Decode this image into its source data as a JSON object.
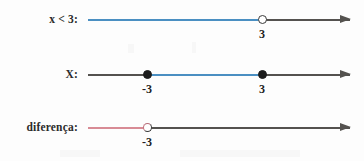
{
  "figure": {
    "type": "number-line-diagram",
    "background_color": "#fdfdfd",
    "axis_color": "#54524f",
    "width": 364,
    "height": 161
  },
  "colors": {
    "blue": "#4a8fc2",
    "red": "#d88b95",
    "dot_fill": "#1c1c1c",
    "text": "#222222"
  },
  "rows": [
    {
      "label": "x < 3:",
      "segment_color": "#4a8fc2",
      "ticks": [
        {
          "label": "3",
          "marker": "open"
        }
      ]
    },
    {
      "label": "X:",
      "segment_color": "#4a8fc2",
      "ticks": [
        {
          "label": "-3",
          "marker": "filled"
        },
        {
          "label": "3",
          "marker": "filled"
        }
      ]
    },
    {
      "label": "diferença:",
      "segment_color": "#d88b95",
      "ticks": [
        {
          "label": "-3",
          "marker": "open"
        }
      ]
    }
  ]
}
